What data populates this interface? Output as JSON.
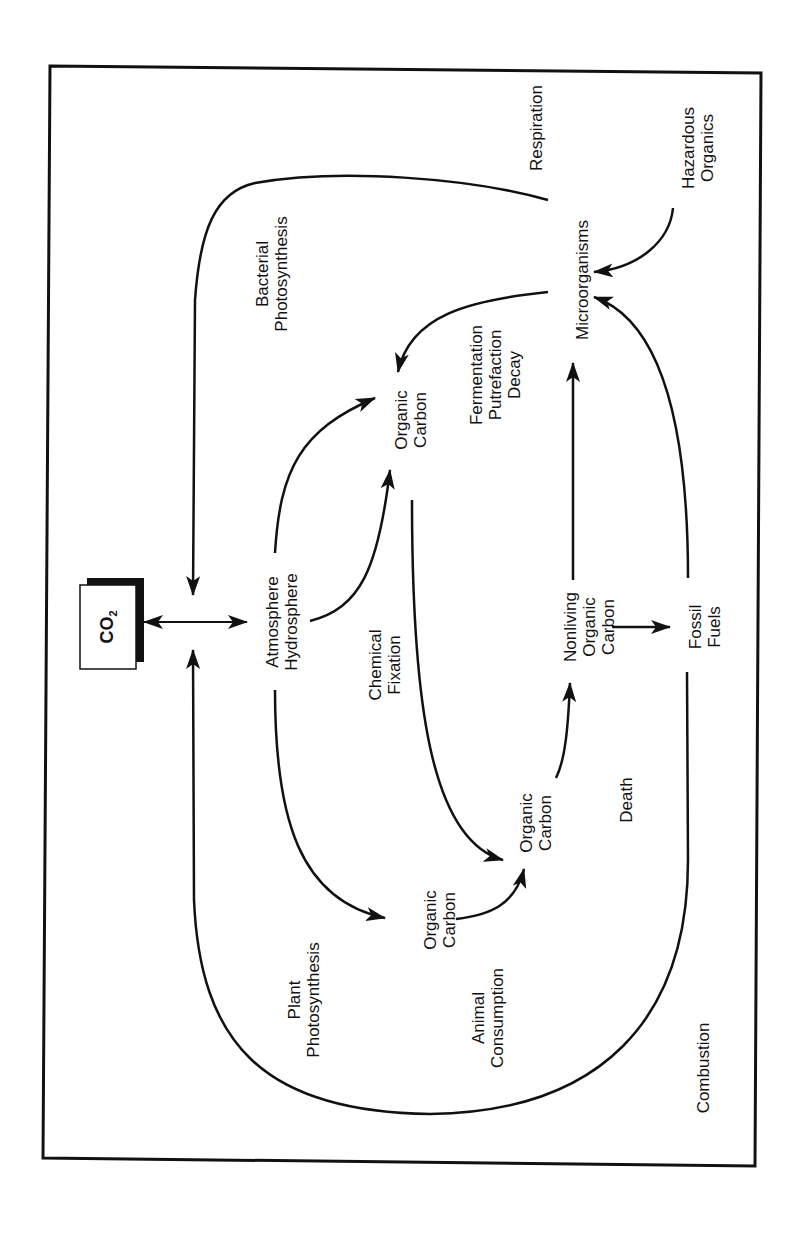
{
  "diagram": {
    "co2_box": {
      "label": "CO",
      "subscript": "2"
    },
    "nodes": [
      {
        "id": "atmosphere",
        "lines": [
          "Atmosphere",
          "Hydrosphere"
        ]
      },
      {
        "id": "organic-carbon-top",
        "lines": [
          "Organic",
          "Carbon"
        ]
      },
      {
        "id": "microorganisms",
        "lines": [
          "Microorganisms"
        ]
      },
      {
        "id": "hazardous-organics",
        "lines": [
          "Hazardous",
          "Organics"
        ]
      },
      {
        "id": "nonliving-organic-carbon",
        "lines": [
          "Nonliving",
          "Organic",
          "Carbon"
        ]
      },
      {
        "id": "fossil-fuels",
        "lines": [
          "Fossil",
          "Fuels"
        ]
      },
      {
        "id": "organic-carbon-middle",
        "lines": [
          "Organic",
          "Carbon"
        ]
      },
      {
        "id": "organic-carbon-lower",
        "lines": [
          "Organic",
          "Carbon"
        ]
      }
    ],
    "processes": [
      {
        "id": "respiration",
        "lines": [
          "Respiration"
        ]
      },
      {
        "id": "bacterial-photosynthesis",
        "lines": [
          "Bacterial",
          "Photosynthesis"
        ]
      },
      {
        "id": "fermentation",
        "lines": [
          "Fermentation",
          "Putrefaction",
          "Decay"
        ]
      },
      {
        "id": "chemical-fixation",
        "lines": [
          "Chemical",
          "Fixation"
        ]
      },
      {
        "id": "death",
        "lines": [
          "Death"
        ]
      },
      {
        "id": "plant-photosynthesis",
        "lines": [
          "Plant",
          "Photosynthesis"
        ]
      },
      {
        "id": "animal-consumption",
        "lines": [
          "Animal",
          "Consumption"
        ]
      },
      {
        "id": "combustion",
        "lines": [
          "Combustion"
        ]
      }
    ],
    "edges": [
      {
        "from": "CO2",
        "to": "atmosphere",
        "bidirectional": true
      },
      {
        "from": "microorganisms",
        "to": "CO2",
        "via": "respiration"
      },
      {
        "from": "fossil-fuels",
        "to": "CO2",
        "via": "combustion"
      },
      {
        "from": "atmosphere",
        "to": "organic-carbon-top",
        "via": "bacterial-photosynthesis"
      },
      {
        "from": "atmosphere",
        "to": "organic-carbon-top",
        "via": "chemical-fixation"
      },
      {
        "from": "atmosphere",
        "to": "organic-carbon-lower",
        "via": "plant-photosynthesis"
      },
      {
        "from": "microorganisms",
        "to": "organic-carbon-top",
        "via": "fermentation"
      },
      {
        "from": "hazardous-organics",
        "to": "microorganisms"
      },
      {
        "from": "fossil-fuels",
        "to": "microorganisms"
      },
      {
        "from": "nonliving-organic-carbon",
        "to": "microorganisms"
      },
      {
        "from": "nonliving-organic-carbon",
        "to": "fossil-fuels"
      },
      {
        "from": "organic-carbon-middle",
        "to": "nonliving-organic-carbon",
        "via": "death"
      },
      {
        "from": "organic-carbon-top",
        "to": "organic-carbon-middle"
      },
      {
        "from": "organic-carbon-lower",
        "to": "organic-carbon-middle",
        "via": "animal-consumption"
      }
    ],
    "colors": {
      "ink": "#111111",
      "background": "#ffffff"
    }
  }
}
